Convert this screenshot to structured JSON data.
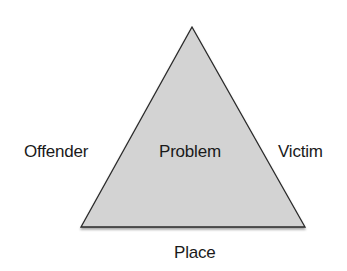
{
  "diagram": {
    "type": "problem-analysis-triangle",
    "center_label": "Problem",
    "sides": {
      "left": "Offender",
      "right": "Victim",
      "bottom": "Place"
    },
    "colors": {
      "fill": "#d3d3d3",
      "stroke": "#2a2a2a",
      "text": "#1a1a1a",
      "background": "#ffffff"
    }
  }
}
